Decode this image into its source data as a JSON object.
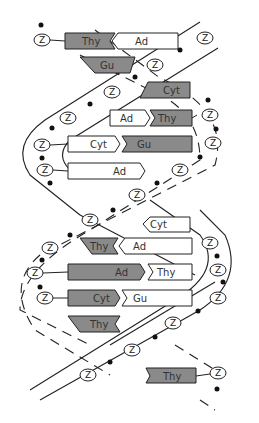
{
  "diagram": {
    "type": "DNA double helix",
    "colors": {
      "background": "#ffffff",
      "stroke": "#222222",
      "purine_fill": "#8a8a8a",
      "pyrimidine_fill": "#ffffff",
      "phosphate": "#111111"
    },
    "sugar_label": "Z",
    "base_pairs": [
      {
        "left": "Thy",
        "right": "Ad"
      },
      {
        "left": "Gu",
        "right": ""
      },
      {
        "left": "",
        "right": "Cyt"
      },
      {
        "left": "Ad",
        "right": "Thy"
      },
      {
        "left": "Cyt",
        "right": "Gu"
      },
      {
        "left": "Ad",
        "right": ""
      },
      {
        "left": "",
        "right": "Cyt"
      },
      {
        "left": "Thy",
        "right": "Ad"
      },
      {
        "left": "Ad",
        "right": "Thy"
      },
      {
        "left": "Cyt",
        "right": "Gu"
      },
      {
        "left": "Thy",
        "right": ""
      },
      {
        "left": "",
        "right": "Thy"
      }
    ]
  }
}
